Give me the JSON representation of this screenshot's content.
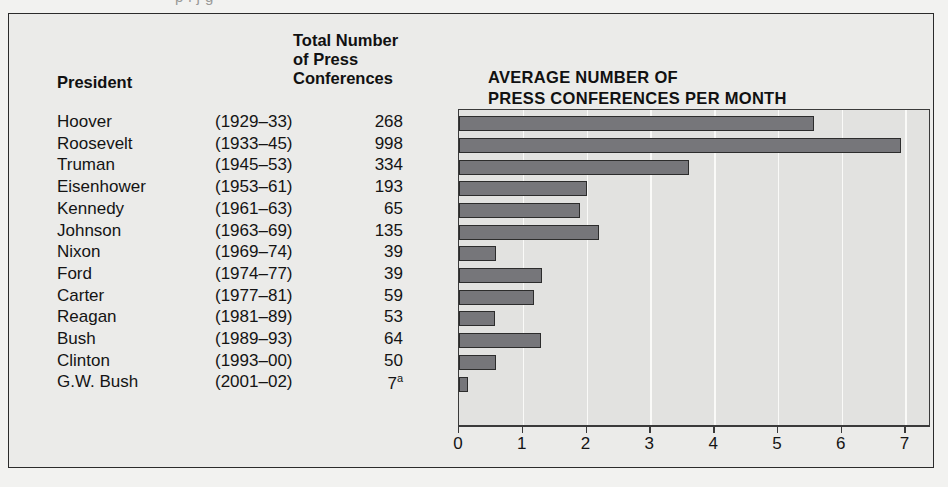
{
  "page": {
    "bleed_text": "p         l                      j    g"
  },
  "table": {
    "headers": {
      "president": "President",
      "total_line1": "Total Number",
      "total_line2": "of Press",
      "total_line3": "Conferences"
    },
    "rows": [
      {
        "name": "Hoover",
        "years": "(1929–33)",
        "count": "268",
        "footnote": ""
      },
      {
        "name": "Roosevelt",
        "years": "(1933–45)",
        "count": "998",
        "footnote": ""
      },
      {
        "name": "Truman",
        "years": "(1945–53)",
        "count": "334",
        "footnote": ""
      },
      {
        "name": "Eisenhower",
        "years": "(1953–61)",
        "count": "193",
        "footnote": ""
      },
      {
        "name": "Kennedy",
        "years": "(1961–63)",
        "count": "65",
        "footnote": ""
      },
      {
        "name": "Johnson",
        "years": "(1963–69)",
        "count": "135",
        "footnote": ""
      },
      {
        "name": "Nixon",
        "years": "(1969–74)",
        "count": "39",
        "footnote": ""
      },
      {
        "name": "Ford",
        "years": "(1974–77)",
        "count": "39",
        "footnote": ""
      },
      {
        "name": "Carter",
        "years": "(1977–81)",
        "count": "59",
        "footnote": ""
      },
      {
        "name": "Reagan",
        "years": "(1981–89)",
        "count": "53",
        "footnote": ""
      },
      {
        "name": "Bush",
        "years": "(1989–93)",
        "count": "64",
        "footnote": ""
      },
      {
        "name": "Clinton",
        "years": "(1993–00)",
        "count": "50",
        "footnote": ""
      },
      {
        "name": "G.W. Bush",
        "years": "(2001–02)",
        "count": "7",
        "footnote": "a"
      }
    ]
  },
  "chart_title_line1": "AVERAGE NUMBER OF",
  "chart_title_line2": "PRESS CONFERENCES PER MONTH",
  "colors": {
    "bar_fill": "#76767a",
    "bar_outline": "#2c2c2c",
    "plot_bg": "#e2e2e0",
    "figure_bg": "#ebebe9",
    "frame": "#2b2b2b",
    "gridline": "#fafaf8"
  },
  "chart_data": {
    "type": "bar",
    "orientation": "horizontal",
    "title": "AVERAGE NUMBER OF PRESS CONFERENCES PER MONTH",
    "xlabel": "",
    "ylabel": "",
    "xlim": [
      0,
      7.4
    ],
    "xticks": [
      0,
      1,
      2,
      3,
      4,
      5,
      6,
      7
    ],
    "xtick_labels": [
      "0",
      "1",
      "2",
      "3",
      "4",
      "5",
      "6",
      "7"
    ],
    "grid": true,
    "legend": null,
    "categories": [
      "Hoover",
      "Roosevelt",
      "Truman",
      "Eisenhower",
      "Kennedy",
      "Johnson",
      "Nixon",
      "Ford",
      "Carter",
      "Reagan",
      "Bush",
      "Clinton",
      "G.W. Bush"
    ],
    "values": [
      5.57,
      6.93,
      3.6,
      2.0,
      1.9,
      2.2,
      0.58,
      1.3,
      1.18,
      0.57,
      1.28,
      0.58,
      0.14
    ],
    "series": [
      {
        "name": "Average press conferences per month",
        "values": [
          5.57,
          6.93,
          3.6,
          2.0,
          1.9,
          2.2,
          0.58,
          1.3,
          1.18,
          0.57,
          1.28,
          0.58,
          0.14
        ]
      }
    ],
    "secondary_table": {
      "columns": [
        "President",
        "Years",
        "Total Number of Press Conferences"
      ],
      "rows": [
        [
          "Hoover",
          "1929–33",
          268
        ],
        [
          "Roosevelt",
          "1933–45",
          998
        ],
        [
          "Truman",
          "1945–53",
          334
        ],
        [
          "Eisenhower",
          "1953–61",
          193
        ],
        [
          "Kennedy",
          "1961–63",
          65
        ],
        [
          "Johnson",
          "1963–69",
          135
        ],
        [
          "Nixon",
          "1969–74",
          39
        ],
        [
          "Ford",
          "1974–77",
          39
        ],
        [
          "Carter",
          "1977–81",
          59
        ],
        [
          "Reagan",
          "1981–89",
          53
        ],
        [
          "Bush",
          "1989–93",
          64
        ],
        [
          "Clinton",
          "1993–00",
          50
        ],
        [
          "G.W. Bush",
          "2001–02",
          7
        ]
      ]
    }
  }
}
